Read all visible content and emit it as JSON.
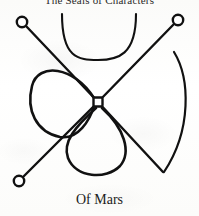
{
  "page": {
    "heading": "The Seals of Characters",
    "caption": "Of Mars",
    "background_color": "#fdfdfc",
    "ink_color": "#111111"
  },
  "figure": {
    "name": "seal-of-mars",
    "center_node": {
      "x": 98,
      "y": 102,
      "size": 9,
      "shape": "square"
    },
    "terminal_nodes": [
      {
        "name": "top-left-node",
        "x": 22,
        "y": 22,
        "r": 5.2
      },
      {
        "name": "top-right-node",
        "x": 178,
        "y": 20,
        "r": 5.2
      },
      {
        "name": "bottom-left-node",
        "x": 19,
        "y": 181,
        "r": 5.2
      },
      {
        "name": "bottom-right-vertex",
        "x": 163,
        "y": 172,
        "r": 0
      }
    ],
    "strokes": [
      {
        "name": "diagonal-top-left-to-center",
        "kind": "line"
      },
      {
        "name": "diagonal-center-to-bottom-right",
        "kind": "line"
      },
      {
        "name": "diagonal-top-right-to-center",
        "kind": "line"
      },
      {
        "name": "diagonal-center-to-bottom-left",
        "kind": "line"
      },
      {
        "name": "upper-u-arc",
        "kind": "arc"
      },
      {
        "name": "right-great-arc",
        "kind": "arc"
      },
      {
        "name": "left-teardrop-loop",
        "kind": "loop"
      },
      {
        "name": "bottom-teardrop-loop",
        "kind": "loop"
      }
    ]
  }
}
